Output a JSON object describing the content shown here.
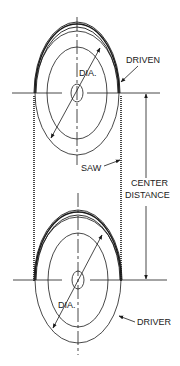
{
  "diagram": {
    "type": "band-saw wheel drive layout",
    "labels": {
      "driven_wheel": "DRIVEN",
      "driver_wheel": "DRIVER",
      "top_diameter": "DIA.",
      "bottom_diameter": "DIA.",
      "saw_blade": "SAW",
      "center_distance_line1": "CENTER",
      "center_distance_line2": "DISTANCE"
    },
    "colors": {
      "line": "#1a1a1a",
      "background": "#ffffff"
    }
  }
}
